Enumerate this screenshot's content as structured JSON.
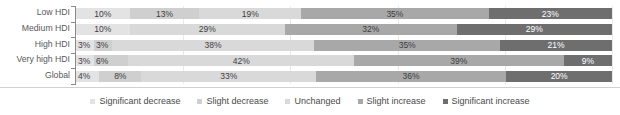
{
  "chart_data": {
    "type": "bar",
    "orientation": "horizontal",
    "stacked": true,
    "stack_mode": "percent",
    "title": "",
    "subtitle": "",
    "xlabel": "",
    "ylabel": "",
    "xlim": [
      0,
      100
    ],
    "grid": true,
    "grid_axis": "x",
    "legend_position": "bottom",
    "categories": [
      "Low HDI",
      "Medium HDI",
      "High HDI",
      "Very high HDI",
      "Global"
    ],
    "series": [
      {
        "name": "Significant decrease",
        "color": "#e3e3e3",
        "values": [
          10,
          10,
          3,
          3,
          4
        ],
        "labels": [
          "10%",
          "10%",
          "3%",
          "3%",
          "4%"
        ]
      },
      {
        "name": "Slight decrease",
        "color": "#cfcfcf",
        "values": [
          13,
          0,
          3,
          6,
          8
        ],
        "labels": [
          "13%",
          "",
          "3%",
          "6%",
          "8%"
        ]
      },
      {
        "name": "Unchanged",
        "color": "#d9d9d9",
        "values": [
          19,
          29,
          38,
          42,
          33
        ],
        "labels": [
          "19%",
          "29%",
          "38%",
          "42%",
          "33%"
        ]
      },
      {
        "name": "Slight increase",
        "color": "#a8a8a8",
        "values": [
          35,
          32,
          35,
          39,
          36
        ],
        "labels": [
          "35%",
          "32%",
          "35%",
          "39%",
          "36%"
        ]
      },
      {
        "name": "Significant increase",
        "color": "#6e6e6e",
        "values": [
          23,
          29,
          21,
          9,
          20
        ],
        "labels": [
          "23%",
          "29%",
          "21%",
          "9%",
          "20%"
        ]
      }
    ],
    "gridline_positions": [
      20,
      40,
      60,
      80,
      100
    ]
  },
  "legend": {
    "items": [
      {
        "label": "Significant decrease",
        "color": "#e3e3e3"
      },
      {
        "label": "Slight decrease",
        "color": "#cfcfcf"
      },
      {
        "label": "Unchanged",
        "color": "#d9d9d9"
      },
      {
        "label": "Slight increase",
        "color": "#a8a8a8"
      },
      {
        "label": "Significant increase",
        "color": "#6e6e6e"
      }
    ]
  }
}
